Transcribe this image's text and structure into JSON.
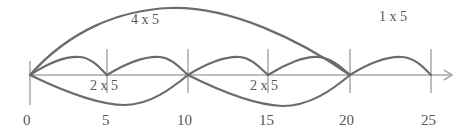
{
  "diagram": {
    "axis": {
      "ticks": [
        {
          "value": "0",
          "x": 30
        },
        {
          "value": "5",
          "x": 107
        },
        {
          "value": "10",
          "x": 188
        },
        {
          "value": "15",
          "x": 268
        },
        {
          "value": "20",
          "x": 350
        },
        {
          "value": "25",
          "x": 431
        }
      ]
    },
    "labels": {
      "four_by_five": "4 x 5",
      "one_by_five": "1 x 5",
      "two_by_five_a": "2 x 5",
      "two_by_five_b": "2 x 5"
    },
    "colors": {
      "curve": "#6b6b6b",
      "axis": "#a8a8a8",
      "text": "#555555"
    }
  }
}
